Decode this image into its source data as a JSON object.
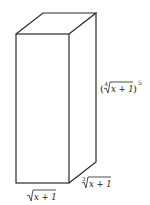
{
  "diagram": {
    "type": "rectangular-prism",
    "stroke_color": "#2a2a2a",
    "labels": {
      "height": {
        "radicand": "x + 1",
        "index": "4",
        "exponent": "5",
        "open": "(",
        "close": ")"
      },
      "depth": {
        "radicand": "x + 1",
        "index": "3"
      },
      "width": {
        "radicand": "x + 1"
      }
    }
  }
}
